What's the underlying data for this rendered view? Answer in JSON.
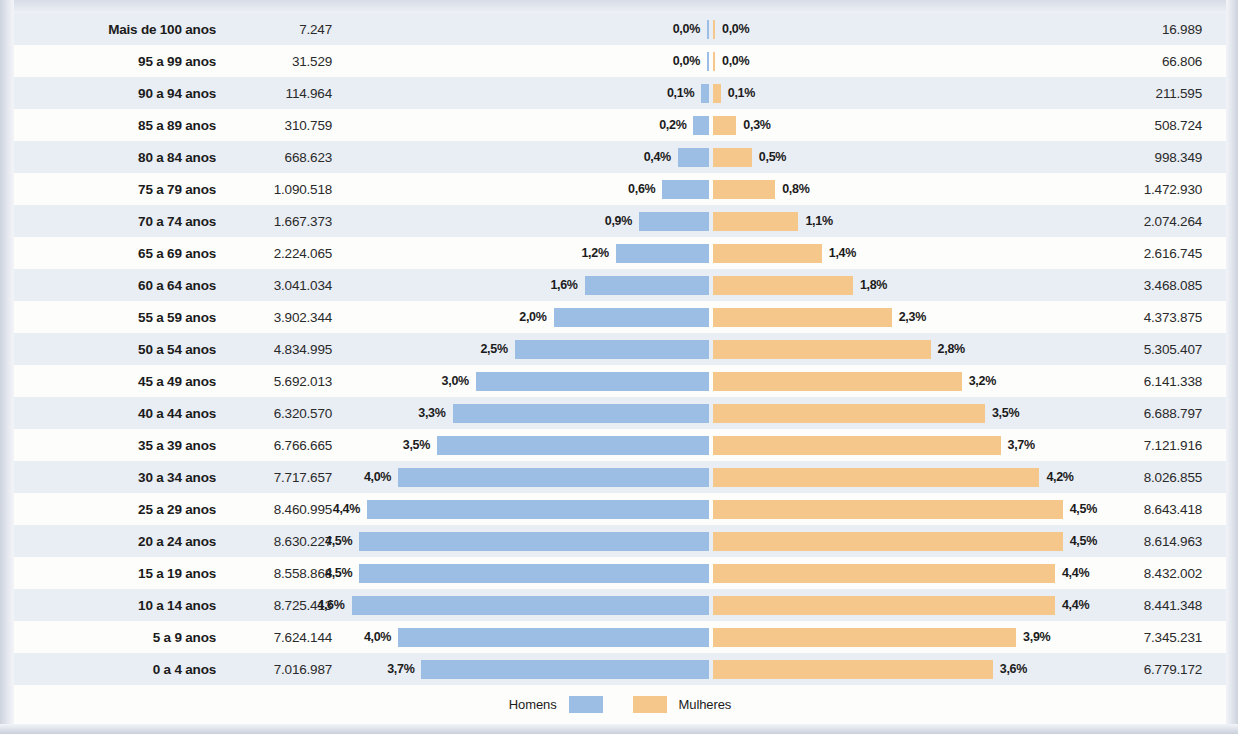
{
  "chart_data": {
    "type": "bar",
    "subtype": "population-pyramid",
    "title": "",
    "xlabel": "",
    "ylabel": "",
    "orientation": "horizontal-diverging",
    "grid": false,
    "legend_position": "bottom",
    "categories": [
      "Mais de 100 anos",
      "95 a 99 anos",
      "90 a 94 anos",
      "85 a 89 anos",
      "80 a 84 anos",
      "75 a 79 anos",
      "70 a 74 anos",
      "65 a 69 anos",
      "60 a 64 anos",
      "55 a 59 anos",
      "50 a 54 anos",
      "45 a 49 anos",
      "40 a 44 anos",
      "35 a 39 anos",
      "30 a 34 anos",
      "25 a 29 anos",
      "20 a 24 anos",
      "15 a 19 anos",
      "10 a 14 anos",
      "5 a 9 anos",
      "0 a 4 anos"
    ],
    "series": [
      {
        "name": "Homens",
        "color": "#9cbde4",
        "side": "left",
        "values": [
          7247,
          31529,
          114964,
          310759,
          668623,
          1090518,
          1667373,
          2224065,
          3041034,
          3902344,
          4834995,
          5692013,
          6320570,
          6766665,
          7717657,
          8460995,
          8630227,
          8558868,
          8725413,
          7624144,
          7016987
        ],
        "value_labels": [
          "7.247",
          "31.529",
          "114.964",
          "310.759",
          "668.623",
          "1.090.518",
          "1.667.373",
          "2.224.065",
          "3.041.034",
          "3.902.344",
          "4.834.995",
          "5.692.013",
          "6.320.570",
          "6.766.665",
          "7.717.657",
          "8.460.995",
          "8.630.227",
          "8.558.868",
          "8.725.413",
          "7.624.144",
          "7.016.987"
        ],
        "percents": [
          0.0,
          0.0,
          0.1,
          0.2,
          0.4,
          0.6,
          0.9,
          1.2,
          1.6,
          2.0,
          2.5,
          3.0,
          3.3,
          3.5,
          4.0,
          4.4,
          4.5,
          4.5,
          4.6,
          4.0,
          3.7
        ],
        "percent_labels": [
          "0,0%",
          "0,0%",
          "0,1%",
          "0,2%",
          "0,4%",
          "0,6%",
          "0,9%",
          "1,2%",
          "1,6%",
          "2,0%",
          "2,5%",
          "3,0%",
          "3,3%",
          "3,5%",
          "4,0%",
          "4,4%",
          "4,5%",
          "4,5%",
          "4,6%",
          "4,0%",
          "3,7%"
        ]
      },
      {
        "name": "Mulheres",
        "color": "#f6c78a",
        "side": "right",
        "values": [
          16989,
          66806,
          211595,
          508724,
          998349,
          1472930,
          2074264,
          2616745,
          3468085,
          4373875,
          5305407,
          6141338,
          6688797,
          7121916,
          8026855,
          8643418,
          8614963,
          8432002,
          8441348,
          7345231,
          6779172
        ],
        "value_labels": [
          "16.989",
          "66.806",
          "211.595",
          "508.724",
          "998.349",
          "1.472.930",
          "2.074.264",
          "2.616.745",
          "3.468.085",
          "4.373.875",
          "5.305.407",
          "6.141.338",
          "6.688.797",
          "7.121.916",
          "8.026.855",
          "8.643.418",
          "8.614.963",
          "8.432.002",
          "8.441.348",
          "7.345.231",
          "6.779.172"
        ],
        "percents": [
          0.0,
          0.0,
          0.1,
          0.3,
          0.5,
          0.8,
          1.1,
          1.4,
          1.8,
          2.3,
          2.8,
          3.2,
          3.5,
          3.7,
          4.2,
          4.5,
          4.5,
          4.4,
          4.4,
          3.9,
          3.6
        ],
        "percent_labels": [
          "0,0%",
          "0,0%",
          "0,1%",
          "0,3%",
          "0,5%",
          "0,8%",
          "1,1%",
          "1,4%",
          "1,8%",
          "2,3%",
          "2,8%",
          "3,2%",
          "3,5%",
          "3,7%",
          "4,2%",
          "4,5%",
          "4,5%",
          "4,4%",
          "4,4%",
          "3,9%",
          "3,6%"
        ]
      }
    ],
    "xlim_percent": [
      0,
      4.8
    ]
  },
  "legend": {
    "male_label": "Homens",
    "female_label": "Mulheres",
    "male_color": "#9cbde4",
    "female_color": "#f6c78a"
  }
}
